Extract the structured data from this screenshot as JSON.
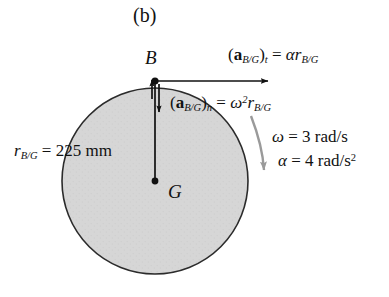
{
  "figure": {
    "caption": "(b)",
    "points": {
      "b_label": "B",
      "g_label": "G"
    },
    "labels": {
      "tangential_acceleration": "(a_B/G)_t = α r_B/G",
      "normal_acceleration": "(a_B/G)_n = ω² r_B/G",
      "radius": "r_B/G = 225 mm",
      "angular_velocity": "ω = 3 rad/s",
      "angular_acceleration": "α = 4 rad/s²"
    },
    "parts": {
      "a_symbol": "a",
      "sub_bg": "B/G",
      "sub_t": "t",
      "sub_n": "n",
      "equals": "=",
      "alpha": "α",
      "omega": "ω",
      "r_symbol": "r",
      "two": "2",
      "radius_value": "225 mm",
      "omega_value": "3 rad/s",
      "alpha_value": "4 rad/s",
      "alpha_value_exp": "2"
    },
    "colors": {
      "disk_fill": "#d4d4d4",
      "disk_stroke": "#2b2b2b",
      "vector_stroke": "#111111",
      "curved_arrow": "#9a9a9a",
      "background": "#ffffff",
      "text": "#111111"
    },
    "geometry": {
      "center_x": 155,
      "center_y": 181,
      "radius_px": 93,
      "point_b_x": 155,
      "point_b_y": 81,
      "tangential_arrow_end_x": 272,
      "normal_arrow_end_y": 115
    }
  }
}
